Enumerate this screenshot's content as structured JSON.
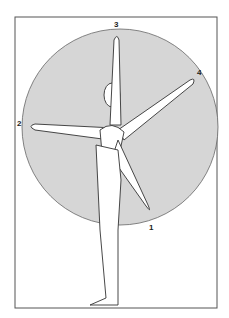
{
  "figure": {
    "labels": [
      {
        "id": "1",
        "text": "1"
      },
      {
        "id": "2",
        "text": "2"
      },
      {
        "id": "3",
        "text": "3"
      },
      {
        "id": "4",
        "text": "4"
      }
    ],
    "colors": {
      "circle_fill": "#d6d6d6",
      "line": "#333333",
      "frame": "#555555",
      "background": "#ffffff"
    }
  }
}
